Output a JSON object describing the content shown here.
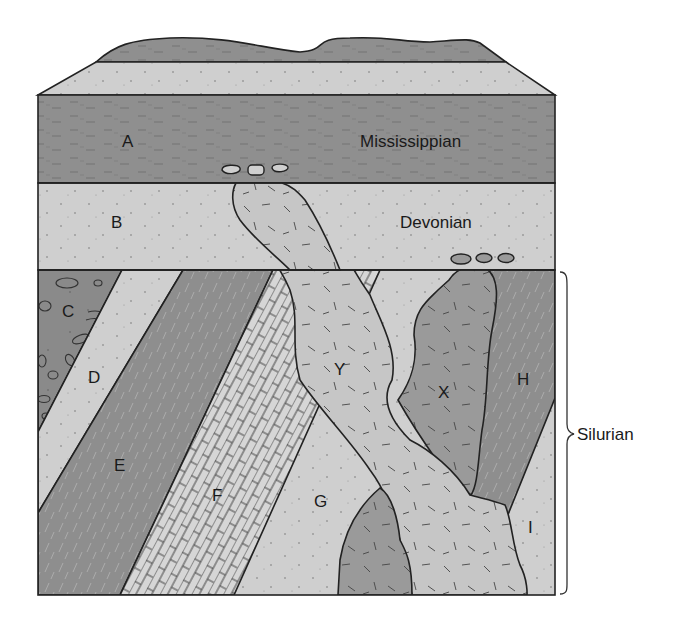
{
  "diagram": {
    "type": "geologic-cross-section",
    "colors": {
      "shale_dark": "#8f8f8f",
      "sandstone_light": "#cfcfcf",
      "conglomerate": "#8a8a8a",
      "limestone": "#d4d4d4",
      "intrusion_y": "#c6c6c6",
      "intrusion_x": "#9a9a9a",
      "outline": "#222222",
      "background": "#ffffff"
    },
    "periods": {
      "mississippian": "Mississippian",
      "devonian": "Devonian",
      "silurian": "Silurian"
    },
    "labels": {
      "A": "A",
      "B": "B",
      "C": "C",
      "D": "D",
      "E": "E",
      "F": "F",
      "G": "G",
      "H": "H",
      "I": "I",
      "X": "X",
      "Y": "Y"
    }
  }
}
